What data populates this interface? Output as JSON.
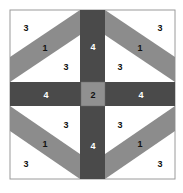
{
  "diagram": {
    "title": "",
    "colors": {
      "dark": "#4a4a4a",
      "medium": "#8c8c8c",
      "center": "#909090",
      "light": "#ffffff",
      "border": "#9a9a9a",
      "label_dark": "#111111",
      "label_light": "#ffffff"
    },
    "labels": {
      "tl_corner": "3",
      "tl_band": "1",
      "tl_inner": "3",
      "tr_corner": "3",
      "tr_band": "1",
      "tr_inner": "3",
      "bl_inner": "3",
      "bl_band": "1",
      "bl_corner": "3",
      "br_inner": "3",
      "br_band": "1",
      "br_corner": "3",
      "top_bar": "4",
      "bottom_bar": "4",
      "left_bar": "4",
      "right_bar": "4",
      "center": "2"
    }
  }
}
